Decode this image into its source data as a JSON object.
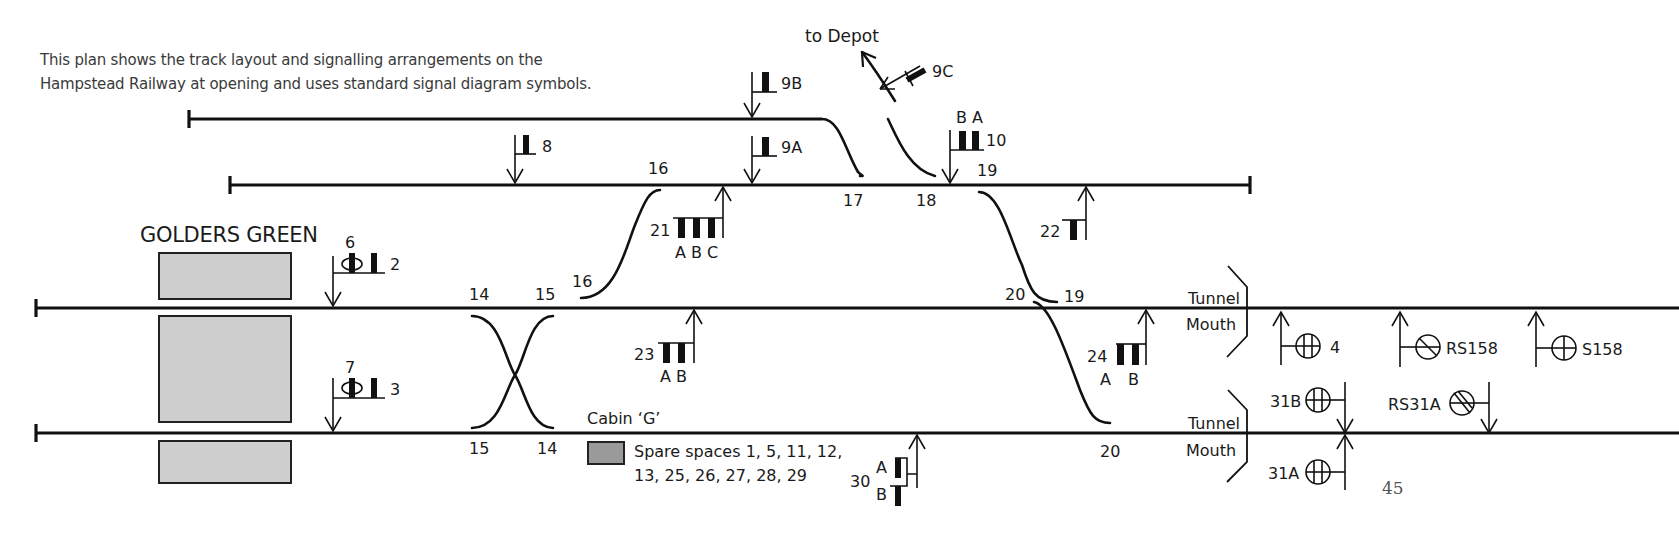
{
  "intro": {
    "line1": "This plan shows the track layout and signalling arrangements on the",
    "line2": "Hampstead Railway at opening and uses standard signal diagram symbols."
  },
  "station": {
    "name": "GOLDERS GREEN"
  },
  "depot": {
    "label": "to Depot"
  },
  "points": {
    "p14_top": "14",
    "p15_top": "15",
    "p15_bot": "15",
    "p14_bot": "14",
    "p16_upper": "16",
    "p16_lower": "16",
    "p17": "17",
    "p18": "18",
    "p19_upper": "19",
    "p19_lower": "19",
    "p20_upper": "20",
    "p20_lower": "20"
  },
  "signals": {
    "s2": "2",
    "s3": "3",
    "s6": "6",
    "s7": "7",
    "s8": "8",
    "s9A": "9A",
    "s9B": "9B",
    "s9C": "9C",
    "s10": "10",
    "s10_arms": "B A",
    "s21": "21",
    "s21_arms": "A B C",
    "s22": "22",
    "s23": "23",
    "s23_arms": "A B",
    "s24": "24",
    "s24_arm_a": "A",
    "s24_arm_b": "B",
    "s30": "30",
    "s30_arm_a": "A",
    "s30_arm_b": "B",
    "s4": "4",
    "sRS158": "RS158",
    "sS158": "S158",
    "s31A": "31A",
    "s31B": "31B",
    "sRS31A": "RS31A"
  },
  "tunnel": {
    "upper_line1": "Tunnel",
    "upper_line2": "Mouth",
    "lower_line1": "Tunnel",
    "lower_line2": "Mouth"
  },
  "cabin": {
    "label": "Cabin ‘G’",
    "spare_line1": "Spare spaces 1, 5, 11, 12,",
    "spare_line2": "13, 25, 26, 27, 28, 29"
  },
  "page_number": "45",
  "colors": {
    "track": "#111111",
    "platform": "#cfcfcf",
    "cabin_key": "#9a9a9a",
    "background": "#ffffff"
  }
}
